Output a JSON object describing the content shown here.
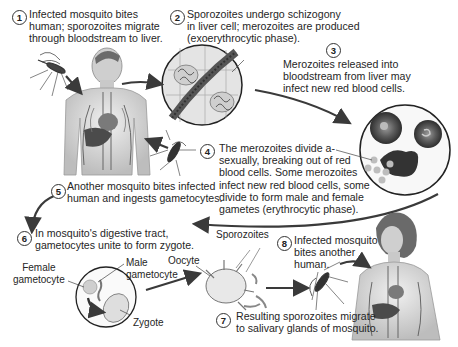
{
  "steps": [
    {
      "number": "1",
      "text": "Infected mosquito bites\nhuman; sporozoites migrate\nthrough bloodstream to liver."
    },
    {
      "number": "2",
      "text": "Sporozoites undergo schizogony\nin liver cell; merozoites are produced\n(exoerythrocytic phase)."
    },
    {
      "number": "3",
      "text": "Merozoites released into\nbloodstream from liver may\ninfect new red blood cells."
    },
    {
      "number": "4",
      "text": "The merozoites divide a-\nsexually, breaking out of red\nblood cells. Some merozoites\ninfect new red blood cells, some\ndivide to form male and female\ngametes (erythrocytic phase)."
    },
    {
      "number": "5",
      "text": "Another mosquito bites infected\nhuman and ingests gametocytes."
    },
    {
      "number": "6",
      "text": "In mosquito's digestive tract,\ngametocytes unite to form zygote."
    },
    {
      "number": "7",
      "text": "Resulting sporozoites migrate\nto salivary glands of mosquito."
    },
    {
      "number": "8",
      "text": "Infected mosquito\nbites another\nhuman."
    }
  ],
  "labels": {
    "female_gametocyte": "Female\ngametocyte",
    "male_gametocyte": "Male\ngametocyte",
    "zygote": "Zygote",
    "oocyte": "Oocyte",
    "sporozoites": "Sporozoites"
  },
  "colors": {
    "arrow": "#3a3a3a",
    "outline": "#222222",
    "tissue": "#d9d9d9",
    "organ": "#555555",
    "rbc": "#4a4a4a"
  }
}
